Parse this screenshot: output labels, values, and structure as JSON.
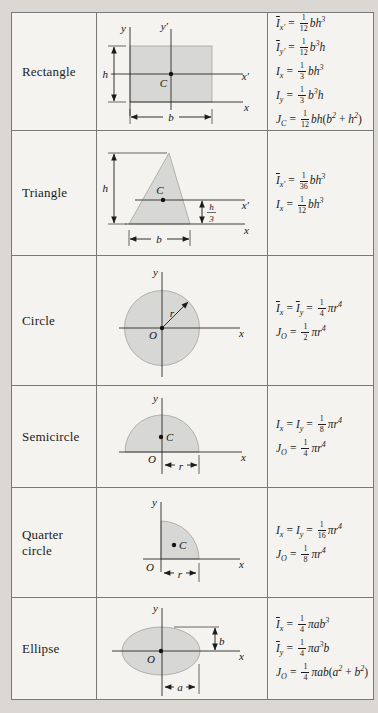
{
  "colors": {
    "page_bg": "#dbd8d3",
    "cell_bg": "#f4f3ef",
    "line": "#787876",
    "shape_fill": "#d7d7d5",
    "shape_stroke": "#a2a2a0",
    "ink": "#1c1c1c"
  },
  "rows": [
    {
      "label": "Rectangle",
      "shape": "rectangle",
      "diagram_labels": {
        "y": "y",
        "y_prime": "y′",
        "x": "x",
        "x_prime": "x′",
        "h": "h",
        "b": "b",
        "centroid": "C"
      },
      "formulas": [
        [
          {
            "k": "sym",
            "v": "I",
            "bar": true,
            "sub": "x′"
          },
          {
            "k": "eq"
          },
          {
            "k": "frac",
            "n": "1",
            "d": "12"
          },
          {
            "k": "sym",
            "v": "bh",
            "sup": "3"
          }
        ],
        [
          {
            "k": "sym",
            "v": "I",
            "bar": true,
            "sub": "y′"
          },
          {
            "k": "eq"
          },
          {
            "k": "frac",
            "n": "1",
            "d": "12"
          },
          {
            "k": "sym",
            "v": "b",
            "sup": "3"
          },
          {
            "k": "sym",
            "v": "h"
          }
        ],
        [
          {
            "k": "sym",
            "v": "I",
            "sub": "x"
          },
          {
            "k": "eq"
          },
          {
            "k": "frac",
            "n": "1",
            "d": "3"
          },
          {
            "k": "sym",
            "v": "bh",
            "sup": "3"
          }
        ],
        [
          {
            "k": "sym",
            "v": "I",
            "sub": "y"
          },
          {
            "k": "eq"
          },
          {
            "k": "frac",
            "n": "1",
            "d": "3"
          },
          {
            "k": "sym",
            "v": "b",
            "sup": "3"
          },
          {
            "k": "sym",
            "v": "h"
          }
        ],
        [
          {
            "k": "sym",
            "v": "J",
            "sub": "C"
          },
          {
            "k": "eq"
          },
          {
            "k": "frac",
            "n": "1",
            "d": "12"
          },
          {
            "k": "sym",
            "v": "bh"
          },
          {
            "k": "pln",
            "v": "("
          },
          {
            "k": "sym",
            "v": "b",
            "sup": "2"
          },
          {
            "k": "pln",
            "v": " + "
          },
          {
            "k": "sym",
            "v": "h",
            "sup": "2"
          },
          {
            "k": "pln",
            "v": ")"
          }
        ]
      ]
    },
    {
      "label": "Triangle",
      "shape": "triangle",
      "diagram_labels": {
        "h": "h",
        "centroid": "C",
        "x_prime": "x′",
        "x": "x",
        "b": "b",
        "frac_num": "h",
        "frac_den": "3"
      },
      "formulas": [
        [
          {
            "k": "sym",
            "v": "I",
            "bar": true,
            "sub": "x′"
          },
          {
            "k": "eq"
          },
          {
            "k": "frac",
            "n": "1",
            "d": "36"
          },
          {
            "k": "sym",
            "v": "bh",
            "sup": "3"
          }
        ],
        [
          {
            "k": "sym",
            "v": "I",
            "sub": "x"
          },
          {
            "k": "eq"
          },
          {
            "k": "frac",
            "n": "1",
            "d": "12"
          },
          {
            "k": "sym",
            "v": "bh",
            "sup": "3"
          }
        ]
      ]
    },
    {
      "label": "Circle",
      "shape": "circle",
      "diagram_labels": {
        "y": "y",
        "x": "x",
        "r": "r",
        "origin": "O"
      },
      "formulas": [
        [
          {
            "k": "sym",
            "v": "I",
            "bar": true,
            "sub": "x"
          },
          {
            "k": "eq"
          },
          {
            "k": "sym",
            "v": "I",
            "bar": true,
            "sub": "y"
          },
          {
            "k": "eq"
          },
          {
            "k": "frac",
            "n": "1",
            "d": "4"
          },
          {
            "k": "sym",
            "v": "πr",
            "sup": "4"
          }
        ],
        [
          {
            "k": "sym",
            "v": "J",
            "sub": "O"
          },
          {
            "k": "eq"
          },
          {
            "k": "frac",
            "n": "1",
            "d": "2"
          },
          {
            "k": "sym",
            "v": "πr",
            "sup": "4"
          }
        ]
      ]
    },
    {
      "label": "Semicircle",
      "shape": "semicircle",
      "diagram_labels": {
        "y": "y",
        "x": "x",
        "centroid": "C",
        "origin": "O",
        "r": "r"
      },
      "formulas": [
        [
          {
            "k": "sym",
            "v": "I",
            "sub": "x"
          },
          {
            "k": "eq"
          },
          {
            "k": "sym",
            "v": "I",
            "sub": "y"
          },
          {
            "k": "eq"
          },
          {
            "k": "frac",
            "n": "1",
            "d": "8"
          },
          {
            "k": "sym",
            "v": "πr",
            "sup": "4"
          }
        ],
        [
          {
            "k": "sym",
            "v": "J",
            "sub": "O"
          },
          {
            "k": "eq"
          },
          {
            "k": "frac",
            "n": "1",
            "d": "4"
          },
          {
            "k": "sym",
            "v": "πr",
            "sup": "4"
          }
        ]
      ]
    },
    {
      "label": "Quarter circle",
      "shape": "quarter-circle",
      "diagram_labels": {
        "y": "y",
        "x": "x",
        "centroid": "C",
        "origin": "O",
        "r": "r"
      },
      "formulas": [
        [
          {
            "k": "sym",
            "v": "I",
            "sub": "x"
          },
          {
            "k": "eq"
          },
          {
            "k": "sym",
            "v": "I",
            "sub": "y"
          },
          {
            "k": "eq"
          },
          {
            "k": "frac",
            "n": "1",
            "d": "16"
          },
          {
            "k": "sym",
            "v": "πr",
            "sup": "4"
          }
        ],
        [
          {
            "k": "sym",
            "v": "J",
            "sub": "O"
          },
          {
            "k": "eq"
          },
          {
            "k": "frac",
            "n": "1",
            "d": "8"
          },
          {
            "k": "sym",
            "v": "πr",
            "sup": "4"
          }
        ]
      ]
    },
    {
      "label": "Ellipse",
      "shape": "ellipse",
      "diagram_labels": {
        "y": "y",
        "x": "x",
        "a": "a",
        "b": "b",
        "origin": "O"
      },
      "formulas": [
        [
          {
            "k": "sym",
            "v": "I",
            "bar": true,
            "sub": "x"
          },
          {
            "k": "eq"
          },
          {
            "k": "frac",
            "n": "1",
            "d": "4"
          },
          {
            "k": "sym",
            "v": "πab",
            "sup": "3"
          }
        ],
        [
          {
            "k": "sym",
            "v": "I",
            "bar": true,
            "sub": "y"
          },
          {
            "k": "eq"
          },
          {
            "k": "frac",
            "n": "1",
            "d": "4"
          },
          {
            "k": "sym",
            "v": "πa",
            "sup": "3"
          },
          {
            "k": "sym",
            "v": "b"
          }
        ],
        [
          {
            "k": "sym",
            "v": "J",
            "sub": "O"
          },
          {
            "k": "eq"
          },
          {
            "k": "frac",
            "n": "1",
            "d": "4"
          },
          {
            "k": "sym",
            "v": "πab"
          },
          {
            "k": "pln",
            "v": "("
          },
          {
            "k": "sym",
            "v": "a",
            "sup": "2"
          },
          {
            "k": "pln",
            "v": " + "
          },
          {
            "k": "sym",
            "v": "b",
            "sup": "2"
          },
          {
            "k": "pln",
            "v": ")"
          }
        ]
      ]
    }
  ]
}
